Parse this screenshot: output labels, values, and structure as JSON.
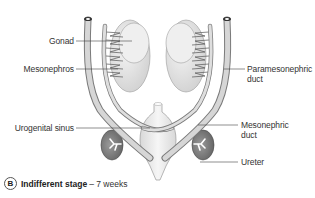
{
  "diagram": {
    "labels": {
      "gonad": "Gonad",
      "mesonephros": "Mesonephros",
      "paramesonephric_duct_line1": "Paramesonephric",
      "paramesonephric_duct_line2": "duct",
      "urogenital_sinus": "Urogenital sinus",
      "mesonephric_duct_line1": "Mesonephric",
      "mesonephric_duct_line2": "duct",
      "ureter": "Ureter"
    },
    "caption": {
      "panel_letter": "B",
      "title": "Indifferent stage",
      "subtitle": "– 7 weeks"
    },
    "colors": {
      "gonad_fill": "#e6e6e6",
      "duct_fill": "#d4d4d4",
      "kidney_fill": "#8a8a8a",
      "sinus_fill": "#eeeeee",
      "line": "#444444"
    }
  }
}
